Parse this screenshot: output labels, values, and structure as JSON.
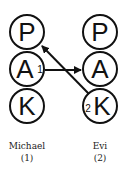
{
  "diagram": {
    "type": "transactional-analysis-ego-states",
    "persons": [
      {
        "name": "Michael",
        "number": "(1)",
        "states": [
          "P",
          "A",
          "K"
        ],
        "marker": "1",
        "marker_state": "A"
      },
      {
        "name": "Evi",
        "number": "(2)",
        "states": [
          "P",
          "A",
          "K"
        ],
        "marker": "2",
        "marker_state": "K"
      }
    ],
    "arrows": [
      {
        "from": "Michael.A",
        "to": "Evi.A",
        "label": "1"
      },
      {
        "from": "Evi.K",
        "to": "Michael.P",
        "label": "2"
      }
    ]
  },
  "left": {
    "p": "P",
    "a": "A",
    "k": "K",
    "marker": "1",
    "name": "Michael",
    "number": "(1)"
  },
  "right": {
    "p": "P",
    "a": "A",
    "k": "K",
    "marker": "2",
    "name": "Evi",
    "number": "(2)"
  }
}
